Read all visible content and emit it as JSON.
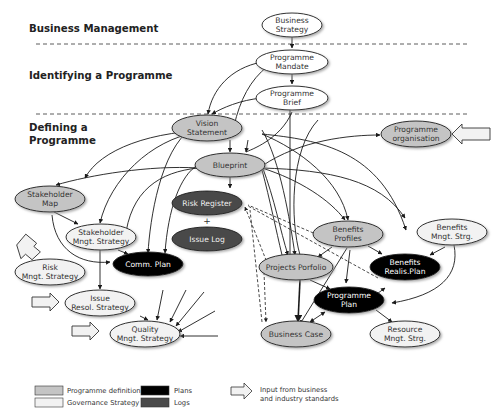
{
  "phases": [
    {
      "label": "Business Management"
    },
    {
      "label": "Identifying a Programme"
    },
    {
      "label": "Defining a",
      "label2": "Programme"
    }
  ],
  "colors": {
    "programme_definition": "#c4c4c4",
    "governance_strategy": "#f2f2f2",
    "plans": "#000000",
    "logs": "#4a4a4a",
    "line": "#1a1a1a"
  },
  "nodes": {
    "business_strategy": {
      "line1": "Business",
      "line2": "Strategy"
    },
    "programme_mandate": {
      "line1": "Programme",
      "line2": "Mandate"
    },
    "programme_brief": {
      "line1": "Programme",
      "line2": "Brief"
    },
    "vision_statement": {
      "line1": "Vision",
      "line2": "Statement"
    },
    "programme_organisation": {
      "line1": "Programme",
      "line2": "organisation"
    },
    "blueprint": {
      "line1": "Blueprint"
    },
    "stakeholder_map": {
      "line1": "Stakeholder",
      "line2": "Map"
    },
    "stakeholder_mngt_strategy": {
      "line1": "Stakeholder",
      "line2": "Mngt. Strategy"
    },
    "risk_register": {
      "line1": "Risk Register"
    },
    "plus": "+",
    "issue_log": {
      "line1": "Issue Log"
    },
    "comm_plan": {
      "line1": "Comm. Plan"
    },
    "benefits_profiles": {
      "line1": "Benefits",
      "line2": "Profiles"
    },
    "benefits_mngt_strg": {
      "line1": "Benefits",
      "line2": "Mngt. Strg."
    },
    "risk_mngt_strategy": {
      "line1": "Risk",
      "line2": "Mngt. Strategy"
    },
    "projects_portfolio": {
      "line1": "Projects Porfolio"
    },
    "benefits_realis_plan": {
      "line1": "Benefits",
      "line2": "Realis.Plan"
    },
    "issue_resol_strategy": {
      "line1": "Issue",
      "line2": "Resol. Strategy"
    },
    "programme_plan": {
      "line1": "Programme",
      "line2": "Plan"
    },
    "quality_mngt_strategy": {
      "line1": "Quality",
      "line2": "Mngt. Strategy"
    },
    "business_case": {
      "line1": "Business Case"
    },
    "resource_mngt_strg": {
      "line1": "Resource",
      "line2": "Mngt. Strg."
    }
  },
  "legend": {
    "programme_definition": "Programme definition",
    "governance_strategy": "Governance Strategy",
    "plans": "Plans",
    "logs": "Logs",
    "input_line1": "Input from business",
    "input_line2": "and industry standards"
  }
}
